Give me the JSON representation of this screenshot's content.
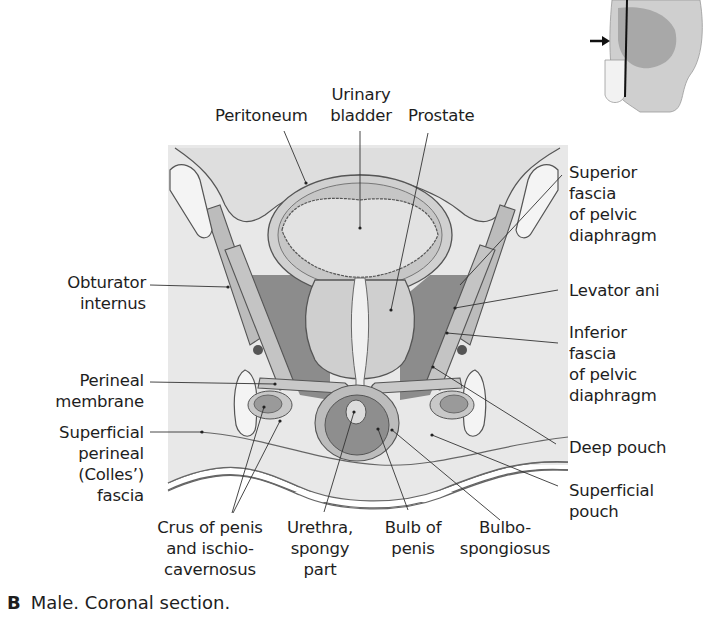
{
  "figure": {
    "caption_letter": "B",
    "caption_text": "Male. Coronal section.",
    "inset": {
      "description": "sagittal-orientation-thumbnail",
      "has_arrow": true,
      "has_section_line": true
    }
  },
  "labels": {
    "peritoneum": "Peritoneum",
    "urinary_bladder": [
      "Urinary",
      "bladder"
    ],
    "prostate": "Prostate",
    "superior_fascia": [
      "Superior",
      "fascia",
      "of pelvic",
      "diaphragm"
    ],
    "levator_ani": "Levator ani",
    "inferior_fascia": [
      "Inferior",
      "fascia",
      "of pelvic",
      "diaphragm"
    ],
    "deep_pouch": "Deep pouch",
    "superficial_pouch": [
      "Superficial",
      "pouch"
    ],
    "obturator_internus": [
      "Obturator",
      "internus"
    ],
    "perineal_membrane": [
      "Perineal",
      "membrane"
    ],
    "superficial_perineal_fascia": [
      "Superficial",
      "perineal",
      "(Colles’)",
      "fascia"
    ],
    "crus_of_penis": [
      "Crus of penis",
      "and ischio-",
      "cavernosus"
    ],
    "urethra_spongy": [
      "Urethra,",
      "spongy",
      "part"
    ],
    "bulb_of_penis": [
      "Bulb of",
      "penis"
    ],
    "bulbospongiosus": [
      "Bulbo-",
      "spongiosus"
    ]
  },
  "colors": {
    "background_panel": "#e6e6e6",
    "tissue_light": "#d4d4d4",
    "tissue_mid": "#bdbdbd",
    "tissue_dark": "#8a8a8a",
    "bone_fill": "#f4f4f4",
    "outline": "#555555",
    "leader_line": "#333333"
  }
}
